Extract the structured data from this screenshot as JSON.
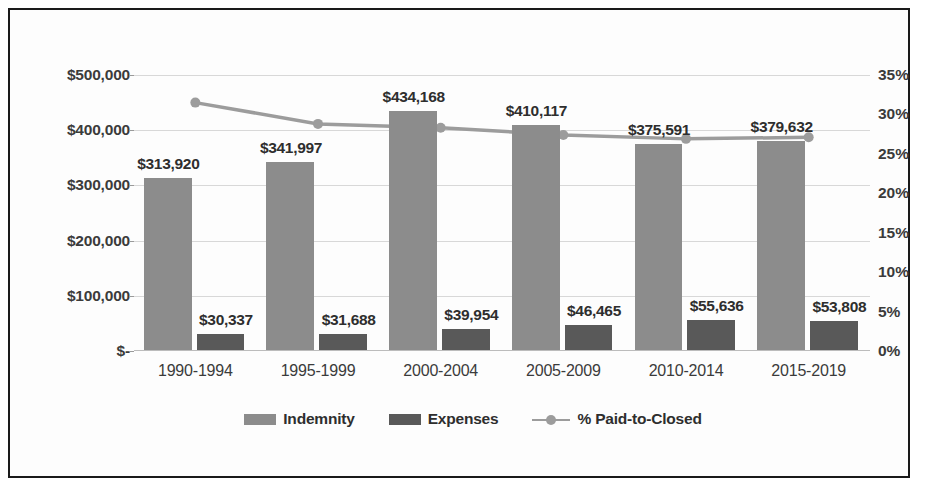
{
  "chart_data": {
    "type": "bar",
    "title": "",
    "xlabel": "",
    "ylabel": "",
    "categories": [
      "1990-1994",
      "1995-1999",
      "2000-2004",
      "2005-2009",
      "2010-2014",
      "2015-2019"
    ],
    "series": [
      {
        "name": "Indemnity",
        "type": "bar",
        "axis": "left",
        "color": "#8c8c8c",
        "values": [
          313920,
          341997,
          434168,
          410117,
          375591,
          379632
        ],
        "data_labels": [
          "$313,920",
          "$341,997",
          "$434,168",
          "$410,117",
          "$375,591",
          "$379,632"
        ]
      },
      {
        "name": "Expenses",
        "type": "bar",
        "axis": "left",
        "color": "#595959",
        "values": [
          30337,
          31688,
          39954,
          46465,
          55636,
          53808
        ],
        "data_labels": [
          "$30,337",
          "$31,688",
          "$39,954",
          "$46,465",
          "$55,636",
          "$53,808"
        ]
      },
      {
        "name": "% Paid-to-Closed",
        "type": "line",
        "axis": "right",
        "color": "#9c9c9c",
        "values": [
          31.5,
          28.8,
          28.3,
          27.4,
          26.9,
          27.1
        ]
      }
    ],
    "left_axis": {
      "ticks": [
        "$500,000",
        "$400,000",
        "$300,000",
        "$200,000",
        "$100,000",
        "$-"
      ],
      "tick_values": [
        500000,
        400000,
        300000,
        200000,
        100000,
        0
      ],
      "ylim": [
        0,
        500000
      ]
    },
    "right_axis": {
      "ticks": [
        "35%",
        "30%",
        "25%",
        "20%",
        "15%",
        "10%",
        "5%",
        "0%"
      ],
      "tick_values": [
        35,
        30,
        25,
        20,
        15,
        10,
        5,
        0
      ],
      "ylim": [
        0,
        35
      ]
    },
    "grid": true,
    "legend_position": "bottom",
    "legend": [
      {
        "label": "Indemnity",
        "marker": "square-swatch",
        "color": "#8c8c8c"
      },
      {
        "label": "Expenses",
        "marker": "square-swatch",
        "color": "#595959"
      },
      {
        "label": "% Paid-to-Closed",
        "marker": "line-with-circle",
        "color": "#9c9c9c"
      }
    ]
  }
}
